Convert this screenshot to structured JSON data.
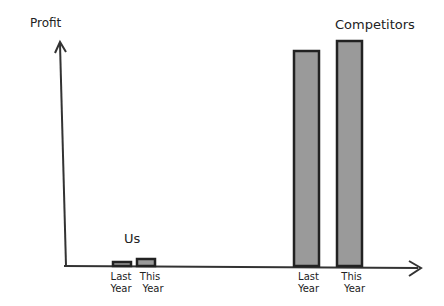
{
  "chart_data": {
    "type": "bar",
    "title": "",
    "ylabel": "Profit",
    "xlabel": "",
    "ylim": [
      0,
      230
    ],
    "grid": false,
    "yticks": [],
    "groups": [
      {
        "name": "Us",
        "categories": [
          "Last Year",
          "This Year"
        ],
        "values": [
          4,
          7
        ]
      },
      {
        "name": "Competitors",
        "categories": [
          "Last Year",
          "This Year"
        ],
        "values": [
          215,
          225
        ]
      }
    ],
    "colors": {
      "bar_fill": "#9a9a9a",
      "bar_stroke": "#222222",
      "axis": "#333333"
    }
  }
}
